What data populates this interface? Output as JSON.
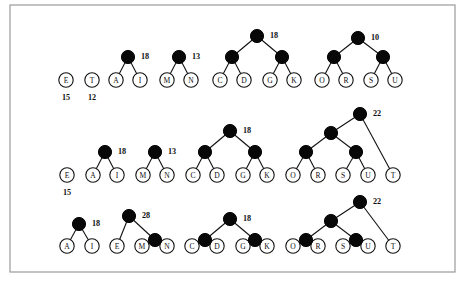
{
  "figure": {
    "frame": {
      "x": 10,
      "y": 5,
      "width": 445,
      "height": 267
    },
    "colors": {
      "internal_node": "#080808",
      "leaf_node_fill": "#ffffff",
      "stroke": "#111111",
      "frame_border": "#9a9a9a",
      "background": "#ffffff"
    },
    "geometry": {
      "leaf_radius": 7.2,
      "internal_radius": 6.6,
      "row_leaf_y": [
        80,
        175,
        246
      ],
      "level_gap": 23
    },
    "rows": [
      {
        "id": "row-1",
        "leaf_y": 80,
        "leaves": [
          {
            "label": "E",
            "x": 66,
            "weight": "15"
          },
          {
            "label": "T",
            "x": 92,
            "weight": "12"
          },
          {
            "label": "A",
            "x": 116,
            "weight": null
          },
          {
            "label": "I",
            "x": 140,
            "weight": null
          },
          {
            "label": "M",
            "x": 167,
            "weight": null
          },
          {
            "label": "N",
            "x": 191,
            "weight": null
          },
          {
            "label": "C",
            "x": 220,
            "weight": null
          },
          {
            "label": "D",
            "x": 244,
            "weight": null
          },
          {
            "label": "G",
            "x": 270,
            "weight": null
          },
          {
            "label": "K",
            "x": 294,
            "weight": null
          },
          {
            "label": "O",
            "x": 322,
            "weight": null
          },
          {
            "label": "R",
            "x": 346,
            "weight": null
          },
          {
            "label": "S",
            "x": 371,
            "weight": null
          },
          {
            "label": "U",
            "x": 395,
            "weight": null
          }
        ],
        "internals": [
          {
            "x": 128,
            "y": 57,
            "weight": "18",
            "children_x": [
              116,
              140
            ],
            "children_y": [
              80,
              80
            ]
          },
          {
            "x": 179,
            "y": 57,
            "weight": "13",
            "children_x": [
              167,
              191
            ],
            "children_y": [
              80,
              80
            ]
          },
          {
            "x": 232,
            "y": 57,
            "weight": null,
            "children_x": [
              220,
              244
            ],
            "children_y": [
              80,
              80
            ]
          },
          {
            "x": 282,
            "y": 57,
            "weight": null,
            "children_x": [
              270,
              294
            ],
            "children_y": [
              80,
              80
            ]
          },
          {
            "x": 257,
            "y": 36,
            "weight": "18",
            "children_x": [
              232,
              282
            ],
            "children_y": [
              57,
              57
            ]
          },
          {
            "x": 334,
            "y": 57,
            "weight": null,
            "children_x": [
              322,
              346
            ],
            "children_y": [
              80,
              80
            ]
          },
          {
            "x": 383,
            "y": 57,
            "weight": null,
            "children_x": [
              371,
              395
            ],
            "children_y": [
              80,
              80
            ]
          },
          {
            "x": 358,
            "y": 38,
            "weight": "10",
            "children_x": [
              334,
              383
            ],
            "children_y": [
              57,
              57
            ]
          }
        ]
      },
      {
        "id": "row-2",
        "leaf_y": 175,
        "leaves": [
          {
            "label": "E",
            "x": 67,
            "weight": "15"
          },
          {
            "label": "A",
            "x": 93,
            "weight": null
          },
          {
            "label": "I",
            "x": 117,
            "weight": null
          },
          {
            "label": "M",
            "x": 143,
            "weight": null
          },
          {
            "label": "N",
            "x": 167,
            "weight": null
          },
          {
            "label": "C",
            "x": 193,
            "weight": null
          },
          {
            "label": "D",
            "x": 217,
            "weight": null
          },
          {
            "label": "G",
            "x": 243,
            "weight": null
          },
          {
            "label": "K",
            "x": 267,
            "weight": null
          },
          {
            "label": "O",
            "x": 293,
            "weight": null
          },
          {
            "label": "R",
            "x": 318,
            "weight": null
          },
          {
            "label": "S",
            "x": 343,
            "weight": null
          },
          {
            "label": "U",
            "x": 368,
            "weight": null
          },
          {
            "label": "T",
            "x": 393,
            "weight": null
          }
        ],
        "internals": [
          {
            "x": 105,
            "y": 152,
            "weight": "18",
            "children_x": [
              93,
              117
            ],
            "children_y": [
              175,
              175
            ]
          },
          {
            "x": 155,
            "y": 152,
            "weight": "13",
            "children_x": [
              143,
              167
            ],
            "children_y": [
              175,
              175
            ]
          },
          {
            "x": 205,
            "y": 152,
            "weight": null,
            "children_x": [
              193,
              217
            ],
            "children_y": [
              175,
              175
            ]
          },
          {
            "x": 255,
            "y": 152,
            "weight": null,
            "children_x": [
              243,
              267
            ],
            "children_y": [
              175,
              175
            ]
          },
          {
            "x": 230,
            "y": 131,
            "weight": "18",
            "children_x": [
              205,
              255
            ],
            "children_y": [
              152,
              152
            ]
          },
          {
            "x": 306,
            "y": 152,
            "weight": null,
            "children_x": [
              293,
              318
            ],
            "children_y": [
              175,
              175
            ]
          },
          {
            "x": 356,
            "y": 152,
            "weight": null,
            "children_x": [
              343,
              368
            ],
            "children_y": [
              175,
              175
            ]
          },
          {
            "x": 331,
            "y": 133,
            "weight": null,
            "children_x": [
              306,
              356
            ],
            "children_y": [
              152,
              152
            ]
          },
          {
            "x": 360,
            "y": 114,
            "weight": "22",
            "children_x": [
              331,
              393
            ],
            "children_y": [
              133,
              175
            ]
          }
        ]
      },
      {
        "id": "row-3",
        "leaf_y": 246,
        "leaves": [
          {
            "label": "A",
            "x": 67,
            "weight": null
          },
          {
            "label": "I",
            "x": 92,
            "weight": null
          },
          {
            "label": "E",
            "x": 117,
            "weight": null
          },
          {
            "label": "M",
            "x": 142,
            "weight": null
          },
          {
            "label": "N",
            "x": 167,
            "weight": null
          },
          {
            "label": "C",
            "x": 192,
            "weight": null
          },
          {
            "label": "D",
            "x": 217,
            "weight": null
          },
          {
            "label": "G",
            "x": 243,
            "weight": null
          },
          {
            "label": "K",
            "x": 267,
            "weight": null
          },
          {
            "label": "O",
            "x": 293,
            "weight": null
          },
          {
            "label": "R",
            "x": 318,
            "weight": null
          },
          {
            "label": "S",
            "x": 343,
            "weight": null
          },
          {
            "label": "U",
            "x": 368,
            "weight": null
          },
          {
            "label": "T",
            "x": 393,
            "weight": null
          }
        ],
        "internals": [
          {
            "x": 79,
            "y": 224,
            "weight": "18",
            "children_x": [
              67,
              92
            ],
            "children_y": [
              246,
              246
            ]
          },
          {
            "x": 155,
            "y": 240,
            "weight": null,
            "children_x": [
              142,
              167
            ],
            "children_y": [
              246,
              246
            ]
          },
          {
            "x": 129,
            "y": 216,
            "weight": "28",
            "children_x": [
              117,
              155
            ],
            "children_y": [
              246,
              240
            ]
          },
          {
            "x": 205,
            "y": 240,
            "weight": null,
            "children_x": [
              192,
              217
            ],
            "children_y": [
              246,
              246
            ]
          },
          {
            "x": 255,
            "y": 240,
            "weight": null,
            "children_x": [
              243,
              267
            ],
            "children_y": [
              246,
              246
            ]
          },
          {
            "x": 230,
            "y": 219,
            "weight": "18",
            "children_x": [
              205,
              255
            ],
            "children_y": [
              240,
              240
            ]
          },
          {
            "x": 306,
            "y": 240,
            "weight": null,
            "children_x": [
              293,
              318
            ],
            "children_y": [
              246,
              246
            ]
          },
          {
            "x": 356,
            "y": 240,
            "weight": null,
            "children_x": [
              343,
              368
            ],
            "children_y": [
              246,
              246
            ]
          },
          {
            "x": 331,
            "y": 221,
            "weight": null,
            "children_x": [
              306,
              356
            ],
            "children_y": [
              240,
              240
            ]
          },
          {
            "x": 360,
            "y": 202,
            "weight": "22",
            "children_x": [
              331,
              393
            ],
            "children_y": [
              221,
              246
            ]
          }
        ]
      }
    ]
  }
}
